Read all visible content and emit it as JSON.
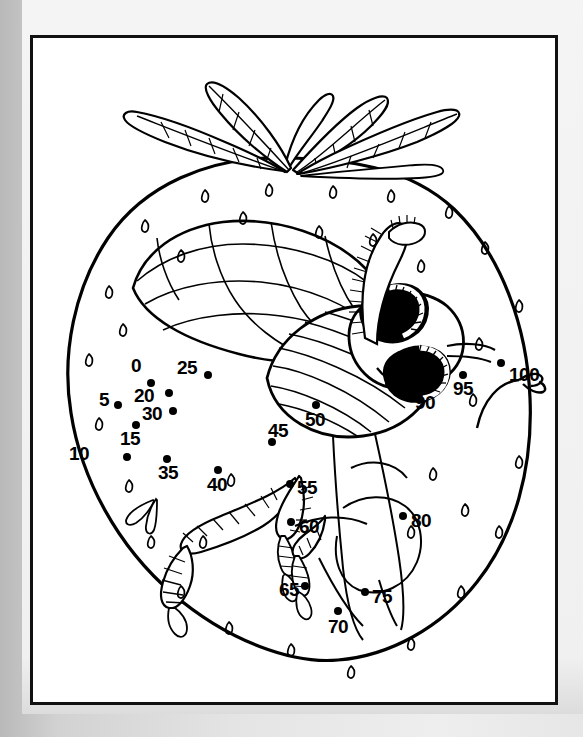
{
  "page": {
    "type": "connect-the-dots-coloring-page",
    "subject_description": "Bee on a strawberry",
    "background_color": "#e4e4e4",
    "paper_color": "#f2f2f2",
    "canvas_color": "#ffffff",
    "ink_color": "#000000",
    "frame": {
      "x": 30,
      "y": 35,
      "width": 528,
      "height": 670,
      "border_width": 3
    }
  },
  "puzzle": {
    "step": 5,
    "start_label": "0",
    "end_label": "100",
    "dots": [
      {
        "label": "0",
        "dot_x": 148,
        "dot_y": 383,
        "label_x": 128,
        "label_y": 356,
        "label_anchor": "left"
      },
      {
        "label": "5",
        "dot_x": 115,
        "dot_y": 405,
        "label_x": 96,
        "label_y": 390,
        "label_anchor": "left"
      },
      {
        "label": "10",
        "dot_x": 124,
        "dot_y": 457,
        "label_x": 66,
        "label_y": 444,
        "label_anchor": "left"
      },
      {
        "label": "15",
        "dot_x": 133,
        "dot_y": 425,
        "label_x": 117,
        "label_y": 429,
        "label_anchor": "left"
      },
      {
        "label": "20",
        "dot_x": 166,
        "dot_y": 393,
        "label_x": 131,
        "label_y": 386,
        "label_anchor": "left"
      },
      {
        "label": "25",
        "dot_x": 205,
        "dot_y": 375,
        "label_x": 174,
        "label_y": 358,
        "label_anchor": "left"
      },
      {
        "label": "30",
        "dot_x": 170,
        "dot_y": 411,
        "label_x": 139,
        "label_y": 404,
        "label_anchor": "left"
      },
      {
        "label": "35",
        "dot_x": 164,
        "dot_y": 459,
        "label_x": 155,
        "label_y": 463,
        "label_anchor": "left"
      },
      {
        "label": "40",
        "dot_x": 215,
        "dot_y": 470,
        "label_x": 204,
        "label_y": 475,
        "label_anchor": "left"
      },
      {
        "label": "45",
        "dot_x": 269,
        "dot_y": 442,
        "label_x": 265,
        "label_y": 421,
        "label_anchor": "left"
      },
      {
        "label": "50",
        "dot_x": 313,
        "dot_y": 405,
        "label_x": 302,
        "label_y": 410,
        "label_anchor": "left"
      },
      {
        "label": "55",
        "dot_x": 287,
        "dot_y": 484,
        "label_x": 294,
        "label_y": 478,
        "label_anchor": "left"
      },
      {
        "label": "60",
        "dot_x": 288,
        "dot_y": 522,
        "label_x": 296,
        "label_y": 517,
        "label_anchor": "left"
      },
      {
        "label": "65",
        "dot_x": 302,
        "dot_y": 586,
        "label_x": 276,
        "label_y": 580,
        "label_anchor": "left"
      },
      {
        "label": "70",
        "dot_x": 335,
        "dot_y": 611,
        "label_x": 325,
        "label_y": 617,
        "label_anchor": "left"
      },
      {
        "label": "75",
        "dot_x": 362,
        "dot_y": 592,
        "label_x": 369,
        "label_y": 587,
        "label_anchor": "left"
      },
      {
        "label": "80",
        "dot_x": 400,
        "dot_y": 516,
        "label_x": 408,
        "label_y": 511,
        "label_anchor": "left"
      },
      {
        "label": "85",
        "dot_x": 386,
        "dot_y": 383,
        "label_x": 394,
        "label_y": 375,
        "label_anchor": "left"
      },
      {
        "label": "90",
        "dot_x": 424,
        "dot_y": 390,
        "label_x": 412,
        "label_y": 393,
        "label_anchor": "left"
      },
      {
        "label": "95",
        "dot_x": 460,
        "dot_y": 375,
        "label_x": 450,
        "label_y": 379,
        "label_anchor": "left"
      },
      {
        "label": "100",
        "dot_x": 498,
        "dot_y": 363,
        "label_x": 506,
        "label_y": 365,
        "label_anchor": "left"
      }
    ]
  },
  "artwork": {
    "strawberry": {
      "name": "strawberry-body",
      "seed_count": 34,
      "outline_stroke": 3.2
    },
    "calyx": {
      "name": "strawberry-leaves",
      "leaf_count": 5,
      "has_stem": true
    },
    "bee": {
      "name": "bee-figure",
      "parts": [
        "wing",
        "thorax",
        "head",
        "eye-left",
        "eye-right",
        "antenna",
        "leg-front",
        "leg-mid",
        "leg-hind",
        "abdomen"
      ],
      "eye_fill": "#000000",
      "eye_highlight": "#ffffff"
    }
  }
}
